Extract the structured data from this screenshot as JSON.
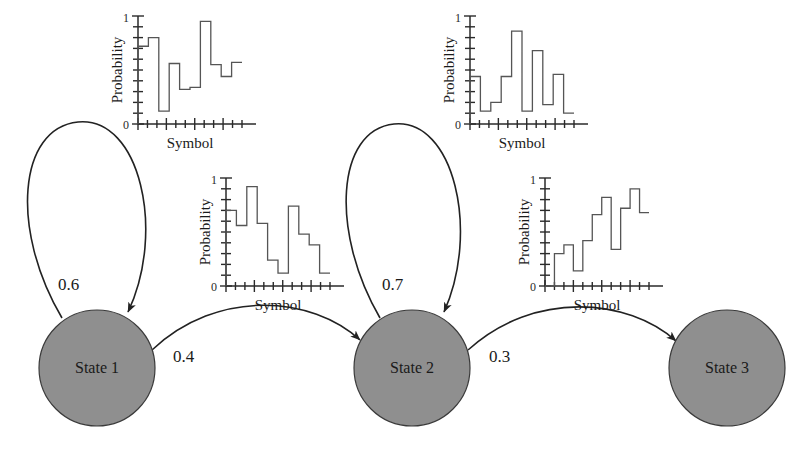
{
  "figure": {
    "background_color": "#ffffff",
    "node_fill_color": "#8f8f8f",
    "node_stroke_color": "#3a3a3a",
    "line_color": "#222222"
  },
  "states": [
    {
      "id": "state-1",
      "label": "State 1",
      "cx": 97,
      "cy": 368,
      "r": 58
    },
    {
      "id": "state-2",
      "label": "State 2",
      "cx": 412,
      "cy": 368,
      "r": 58
    },
    {
      "id": "state-3",
      "label": "State 3",
      "cx": 727,
      "cy": 368,
      "r": 58
    }
  ],
  "transitions": [
    {
      "id": "t-1-1",
      "from": "State 1",
      "to": "State 1",
      "label": "0.6",
      "kind": "self-loop",
      "label_x": 58,
      "label_y": 290
    },
    {
      "id": "t-1-2",
      "from": "State 1",
      "to": "State 2",
      "label": "0.4",
      "kind": "arc",
      "label_x": 178,
      "label_y": 358
    },
    {
      "id": "t-2-2",
      "from": "State 2",
      "to": "State 2",
      "label": "0.7",
      "kind": "self-loop",
      "label_x": 382,
      "label_y": 290
    },
    {
      "id": "t-2-3",
      "from": "State 2",
      "to": "State 3",
      "label": "0.3",
      "kind": "arc",
      "label_x": 494,
      "label_y": 358
    }
  ],
  "chart_data": [
    {
      "id": "chart-state1-a",
      "type": "bar",
      "title": "",
      "xlabel": "Symbol",
      "ylabel": "Probability",
      "ytick_labels": [
        "0",
        "1"
      ],
      "ylim": [
        0,
        1
      ],
      "grid": false,
      "legend": "none",
      "n_minor_xticks": 11,
      "n_minor_yticks": 10,
      "categories": [
        "1",
        "2",
        "3",
        "4",
        "5",
        "6",
        "7",
        "8",
        "9",
        "10"
      ],
      "values": [
        0.72,
        0.8,
        0.12,
        0.56,
        0.32,
        0.34,
        0.95,
        0.55,
        0.44,
        0.57
      ]
    },
    {
      "id": "chart-state1-b",
      "type": "bar",
      "title": "",
      "xlabel": "Symbol",
      "ylabel": "Probability",
      "ytick_labels": [
        "0",
        "1"
      ],
      "ylim": [
        0,
        1
      ],
      "grid": false,
      "legend": "none",
      "n_minor_xticks": 11,
      "n_minor_yticks": 10,
      "categories": [
        "1",
        "2",
        "3",
        "4",
        "5",
        "6",
        "7",
        "8",
        "9",
        "10"
      ],
      "values": [
        0.7,
        0.56,
        0.92,
        0.58,
        0.24,
        0.12,
        0.74,
        0.48,
        0.38,
        0.12
      ]
    },
    {
      "id": "chart-state2-a",
      "type": "bar",
      "title": "",
      "xlabel": "Symbol",
      "ylabel": "Probability",
      "ytick_labels": [
        "0",
        "1"
      ],
      "ylim": [
        0,
        1
      ],
      "grid": false,
      "legend": "none",
      "n_minor_xticks": 11,
      "n_minor_yticks": 10,
      "categories": [
        "1",
        "2",
        "3",
        "4",
        "5",
        "6",
        "7",
        "8",
        "9",
        "10"
      ],
      "values": [
        0.44,
        0.12,
        0.2,
        0.44,
        0.86,
        0.12,
        0.68,
        0.18,
        0.46,
        0.1
      ]
    },
    {
      "id": "chart-state2-b",
      "type": "bar",
      "title": "",
      "xlabel": "Symbol",
      "ylabel": "Probability",
      "ytick_labels": [
        "0",
        "1"
      ],
      "ylim": [
        0,
        1
      ],
      "grid": false,
      "legend": "none",
      "n_minor_xticks": 11,
      "n_minor_yticks": 10,
      "categories": [
        "1",
        "2",
        "3",
        "4",
        "5",
        "6",
        "7",
        "8",
        "9",
        "10"
      ],
      "values": [
        0.0,
        0.3,
        0.38,
        0.14,
        0.42,
        0.66,
        0.82,
        0.34,
        0.72,
        0.9,
        0.68
      ]
    }
  ],
  "chart_layout": [
    {
      "chart": 0,
      "x": 138,
      "y": 16,
      "w": 104,
      "h": 108,
      "ylabel_x": 122,
      "ylabel_y": 70,
      "xlabel_x": 190,
      "xlabel_y": 148
    },
    {
      "chart": 1,
      "x": 226,
      "y": 178,
      "w": 104,
      "h": 108,
      "ylabel_x": 210,
      "ylabel_y": 232,
      "xlabel_x": 278,
      "xlabel_y": 310
    },
    {
      "chart": 2,
      "x": 470,
      "y": 16,
      "w": 104,
      "h": 108,
      "ylabel_x": 454,
      "ylabel_y": 70,
      "xlabel_x": 522,
      "xlabel_y": 148
    },
    {
      "chart": 3,
      "x": 545,
      "y": 178,
      "w": 104,
      "h": 108,
      "ylabel_x": 529,
      "ylabel_y": 232,
      "xlabel_x": 597,
      "xlabel_y": 310
    }
  ]
}
